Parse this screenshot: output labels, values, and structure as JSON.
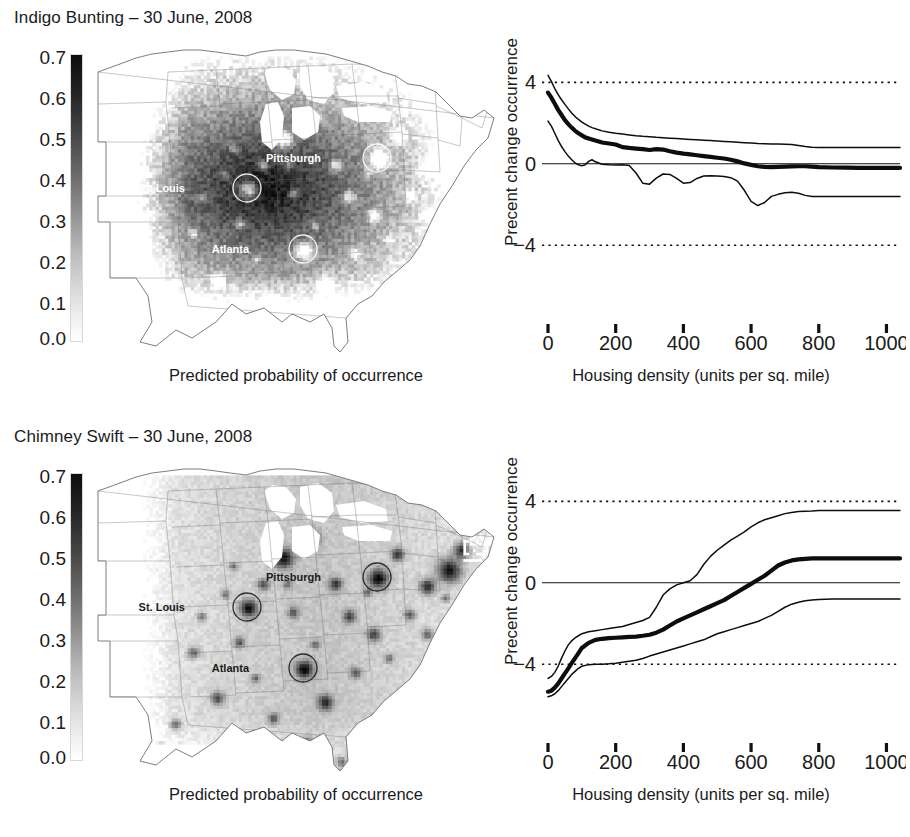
{
  "figure": {
    "xlabel": "Housing density (units per sq. mile)",
    "map_caption": "Predicted probability of occurrence",
    "ylabel": "Precent change occurrence",
    "colorbar_ticks": [
      "0.7",
      "0.6",
      "0.5",
      "0.4",
      "0.3",
      "0.2",
      "0.1",
      "0.0"
    ],
    "colorbar_range": [
      0.0,
      0.7
    ],
    "city_labels": [
      "Pittsburgh",
      "St. Louis",
      "Atlanta"
    ]
  },
  "panels": [
    {
      "title": "Indigo Bunting – 30 June, 2008",
      "map": {
        "caption": "Predicted probability of occurrence",
        "surface": "dark-high-occurrence",
        "label_color": "#ffffff",
        "cities": [
          {
            "name": "Pittsburgh",
            "x": 281,
            "y": 112,
            "label_dx": -56
          },
          {
            "name": "St. Louis",
            "x": 151,
            "y": 142,
            "label_dx": -62
          },
          {
            "name": "Atlanta",
            "x": 207,
            "y": 203,
            "label_dx": -54
          }
        ]
      },
      "chart_data": {
        "type": "line",
        "title": "Indigo Bunting – 30 June, 2008",
        "xlabel": "Housing density (units per sq. mile)",
        "ylabel": "Precent change occurrence",
        "xlim": [
          0,
          1040
        ],
        "ylim": [
          -6.2,
          5.2
        ],
        "xticks": [
          0,
          200,
          400,
          600,
          800,
          1000
        ],
        "yticks": [
          4,
          0,
          -4
        ],
        "grid": false,
        "legend": "none",
        "reference_lines": [
          {
            "y": 4,
            "style": "dotted"
          },
          {
            "y": -4,
            "style": "dotted"
          },
          {
            "y": 0,
            "style": "solid"
          }
        ],
        "x": [
          0,
          10,
          20,
          30,
          40,
          50,
          60,
          70,
          80,
          90,
          100,
          110,
          120,
          130,
          140,
          160,
          180,
          200,
          220,
          240,
          260,
          280,
          300,
          320,
          340,
          360,
          380,
          400,
          420,
          440,
          460,
          480,
          500,
          520,
          540,
          560,
          580,
          600,
          620,
          640,
          660,
          680,
          700,
          720,
          740,
          760,
          780,
          800,
          840,
          880,
          920,
          960,
          1000,
          1040
        ],
        "series": [
          {
            "name": "upper confidence bound",
            "style": "thin",
            "values": [
              4.35,
              4.05,
              3.7,
              3.4,
              3.15,
              2.92,
              2.7,
              2.5,
              2.32,
              2.18,
              2.05,
              1.95,
              1.85,
              1.78,
              1.72,
              1.62,
              1.55,
              1.5,
              1.46,
              1.42,
              1.38,
              1.35,
              1.33,
              1.3,
              1.28,
              1.26,
              1.24,
              1.22,
              1.2,
              1.18,
              1.16,
              1.14,
              1.12,
              1.1,
              1.08,
              1.06,
              1.04,
              1.02,
              1.0,
              0.99,
              0.98,
              0.97,
              0.96,
              0.95,
              0.9,
              0.85,
              0.82,
              0.8,
              0.8,
              0.8,
              0.8,
              0.8,
              0.8,
              0.8
            ]
          },
          {
            "name": "mean percent change",
            "style": "thick",
            "values": [
              3.5,
              3.25,
              2.95,
              2.65,
              2.4,
              2.15,
              1.95,
              1.78,
              1.62,
              1.5,
              1.4,
              1.3,
              1.25,
              1.2,
              1.15,
              1.05,
              1.0,
              0.95,
              0.82,
              0.78,
              0.75,
              0.72,
              0.68,
              0.72,
              0.7,
              0.62,
              0.55,
              0.5,
              0.46,
              0.42,
              0.38,
              0.34,
              0.3,
              0.26,
              0.2,
              0.12,
              0.02,
              -0.05,
              -0.12,
              -0.15,
              -0.16,
              -0.15,
              -0.14,
              -0.13,
              -0.12,
              -0.12,
              -0.14,
              -0.16,
              -0.18,
              -0.19,
              -0.2,
              -0.2,
              -0.2,
              -0.2
            ]
          },
          {
            "name": "lower confidence bound",
            "style": "thin",
            "values": [
              2.1,
              1.85,
              1.5,
              1.15,
              0.85,
              0.6,
              0.38,
              0.2,
              0.05,
              -0.05,
              -0.1,
              -0.05,
              0.12,
              0.2,
              0.1,
              -0.02,
              -0.05,
              -0.06,
              -0.05,
              -0.08,
              -0.45,
              -0.95,
              -1.0,
              -0.7,
              -0.5,
              -0.52,
              -0.72,
              -0.95,
              -0.92,
              -0.72,
              -0.6,
              -0.58,
              -0.6,
              -0.62,
              -0.68,
              -0.85,
              -1.3,
              -1.85,
              -2.05,
              -1.9,
              -1.6,
              -1.5,
              -1.42,
              -1.4,
              -1.45,
              -1.55,
              -1.6,
              -1.6,
              -1.6,
              -1.6,
              -1.6,
              -1.6,
              -1.6,
              -1.6
            ]
          }
        ]
      }
    },
    {
      "title": "Chimney Swift – 30 June, 2008",
      "map": {
        "caption": "Predicted probability of occurrence",
        "surface": "light-urban-hotspots",
        "label_color": "#1b1b1b",
        "cities": [
          {
            "name": "Pittsburgh",
            "x": 281,
            "y": 112,
            "label_dx": -56
          },
          {
            "name": "St. Louis",
            "x": 151,
            "y": 142,
            "label_dx": -62
          },
          {
            "name": "Atlanta",
            "x": 207,
            "y": 203,
            "label_dx": -54
          }
        ]
      },
      "chart_data": {
        "type": "line",
        "title": "Chimney Swift – 30 June, 2008",
        "xlabel": "Housing density (units per sq. mile)",
        "ylabel": "Precent change occurrence",
        "xlim": [
          0,
          1040
        ],
        "ylim": [
          -6.2,
          5.2
        ],
        "xticks": [
          0,
          200,
          400,
          600,
          800,
          1000
        ],
        "yticks": [
          4,
          0,
          -4
        ],
        "grid": false,
        "legend": "none",
        "reference_lines": [
          {
            "y": 4,
            "style": "dotted"
          },
          {
            "y": -4,
            "style": "dotted"
          },
          {
            "y": 0,
            "style": "solid"
          }
        ],
        "x": [
          0,
          10,
          20,
          30,
          40,
          50,
          60,
          70,
          80,
          90,
          100,
          120,
          140,
          160,
          180,
          200,
          220,
          240,
          260,
          280,
          300,
          320,
          340,
          360,
          380,
          400,
          420,
          440,
          460,
          480,
          500,
          520,
          540,
          560,
          580,
          600,
          620,
          640,
          660,
          680,
          700,
          720,
          740,
          760,
          780,
          800,
          840,
          880,
          920,
          960,
          1000,
          1040
        ],
        "series": [
          {
            "name": "upper confidence bound",
            "style": "thin",
            "values": [
              -4.7,
              -4.6,
              -4.4,
              -4.1,
              -3.7,
              -3.35,
              -3.05,
              -2.85,
              -2.7,
              -2.6,
              -2.5,
              -2.4,
              -2.35,
              -2.3,
              -2.25,
              -2.2,
              -2.15,
              -2.05,
              -1.95,
              -1.85,
              -1.7,
              -1.2,
              -0.6,
              -0.3,
              -0.1,
              0.0,
              0.1,
              0.4,
              0.9,
              1.3,
              1.6,
              1.85,
              2.1,
              2.3,
              2.5,
              2.75,
              2.95,
              3.1,
              3.2,
              3.3,
              3.4,
              3.45,
              3.5,
              3.52,
              3.53,
              3.55,
              3.55,
              3.55,
              3.55,
              3.55,
              3.55,
              3.55
            ]
          },
          {
            "name": "mean percent change",
            "style": "thick",
            "values": [
              -5.35,
              -5.3,
              -5.15,
              -4.95,
              -4.7,
              -4.45,
              -4.2,
              -3.95,
              -3.7,
              -3.45,
              -3.2,
              -2.95,
              -2.8,
              -2.75,
              -2.72,
              -2.7,
              -2.68,
              -2.66,
              -2.64,
              -2.6,
              -2.55,
              -2.45,
              -2.3,
              -2.1,
              -1.9,
              -1.75,
              -1.6,
              -1.45,
              -1.3,
              -1.15,
              -1.0,
              -0.85,
              -0.65,
              -0.45,
              -0.25,
              -0.05,
              0.15,
              0.35,
              0.6,
              0.85,
              1.0,
              1.1,
              1.15,
              1.18,
              1.2,
              1.2,
              1.2,
              1.2,
              1.2,
              1.2,
              1.2,
              1.2
            ]
          },
          {
            "name": "lower confidence bound",
            "style": "thin",
            "values": [
              -5.6,
              -5.55,
              -5.45,
              -5.3,
              -5.1,
              -4.9,
              -4.7,
              -4.5,
              -4.35,
              -4.2,
              -4.1,
              -4.02,
              -4.0,
              -4.0,
              -3.98,
              -3.95,
              -3.9,
              -3.85,
              -3.8,
              -3.72,
              -3.6,
              -3.5,
              -3.4,
              -3.3,
              -3.2,
              -3.1,
              -3.0,
              -2.9,
              -2.8,
              -2.65,
              -2.5,
              -2.4,
              -2.3,
              -2.2,
              -2.1,
              -2.0,
              -1.9,
              -1.75,
              -1.6,
              -1.4,
              -1.2,
              -1.05,
              -0.95,
              -0.88,
              -0.85,
              -0.82,
              -0.8,
              -0.8,
              -0.8,
              -0.8,
              -0.8,
              -0.8
            ]
          }
        ]
      }
    }
  ]
}
